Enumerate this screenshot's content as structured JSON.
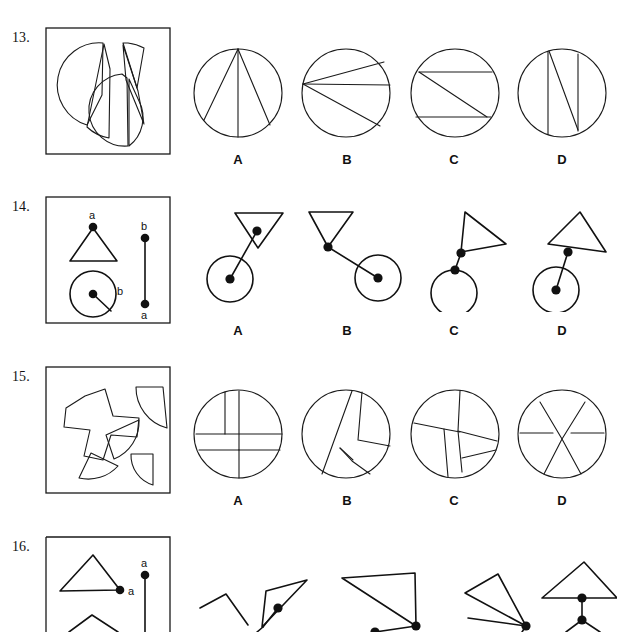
{
  "page": {
    "width": 612,
    "height": 632,
    "background": "#ffffff",
    "ink_color": "#1a1a1a"
  },
  "option_labels": [
    "A",
    "B",
    "C",
    "D"
  ],
  "questions": [
    {
      "number": "13.",
      "number_x": 14,
      "number_y": 32,
      "stimulus_box": {
        "x": 46,
        "y": 28,
        "width": 124,
        "height": 126
      },
      "stimulus_type": "disassembled-circle-pieces",
      "options_y_label": 156,
      "options": [
        {
          "label": "A",
          "label_x": 228,
          "label_y": 156,
          "shape": "circle",
          "cx": 238,
          "cy": 93,
          "r": 44,
          "chords": [
            [
              238,
              49,
              203,
              134
            ],
            [
              238,
              49,
              238,
              137
            ],
            [
              238,
              49,
              272,
              131
            ]
          ]
        },
        {
          "label": "B",
          "label_x": 337,
          "label_y": 156,
          "shape": "circle",
          "cx": 347,
          "cy": 93,
          "r": 44,
          "chords": [
            [
              304,
              84,
              384,
              62
            ],
            [
              304,
              84,
              391,
              84
            ],
            [
              304,
              84,
              381,
              125
            ]
          ]
        },
        {
          "label": "C",
          "label_x": 444,
          "label_y": 156,
          "shape": "circle",
          "cx": 455,
          "cy": 93,
          "r": 44,
          "chords": [
            [
              418,
              72,
              492,
              72
            ],
            [
              418,
              72,
              487,
              117
            ],
            [
              415,
              117,
              490,
              117
            ]
          ]
        },
        {
          "label": "D",
          "label_x": 552,
          "label_y": 156,
          "shape": "circle",
          "cx": 562,
          "cy": 93,
          "r": 44,
          "chords": [
            [
              548,
              51,
              548,
              135
            ],
            [
              549,
              50,
              578,
              128
            ],
            [
              578,
              54,
              578,
              130
            ]
          ]
        }
      ]
    },
    {
      "number": "14.",
      "number_x": 14,
      "number_y": 200,
      "stimulus_box": {
        "x": 46,
        "y": 197,
        "width": 124,
        "height": 126
      },
      "stimulus_type": "shapes-with-labeled-dots",
      "stimulus_letters": [
        "a",
        "b",
        "b",
        "a"
      ],
      "options_y_label": 327,
      "options": [
        {
          "label": "A",
          "label_x": 228,
          "label_y": 327
        },
        {
          "label": "B",
          "label_x": 337,
          "label_y": 327
        },
        {
          "label": "C",
          "label_x": 444,
          "label_y": 327
        },
        {
          "label": "D",
          "label_x": 552,
          "label_y": 327
        }
      ]
    },
    {
      "number": "15.",
      "number_x": 14,
      "number_y": 370,
      "stimulus_box": {
        "x": 46,
        "y": 367,
        "width": 124,
        "height": 126
      },
      "stimulus_type": "disassembled-circle-pieces",
      "options_y_label": 497,
      "options": [
        {
          "label": "A",
          "label_x": 228,
          "label_y": 497,
          "cx": 238,
          "cy": 434,
          "r": 44
        },
        {
          "label": "B",
          "label_x": 337,
          "label_y": 497,
          "cx": 347,
          "cy": 434,
          "r": 44
        },
        {
          "label": "C",
          "label_x": 444,
          "label_y": 497,
          "cx": 455,
          "cy": 434,
          "r": 44
        },
        {
          "label": "D",
          "label_x": 552,
          "label_y": 497,
          "cx": 562,
          "cy": 434,
          "r": 44
        }
      ]
    },
    {
      "number": "16.",
      "number_x": 14,
      "number_y": 540,
      "stimulus_box": {
        "x": 46,
        "y": 537,
        "width": 124,
        "height": 95
      },
      "stimulus_type": "shapes-with-labeled-dots",
      "stimulus_letters": [
        "a",
        "a"
      ],
      "cropped": true,
      "options": [
        {
          "label": "A"
        },
        {
          "label": "B"
        },
        {
          "label": "C"
        },
        {
          "label": "D"
        }
      ]
    }
  ]
}
